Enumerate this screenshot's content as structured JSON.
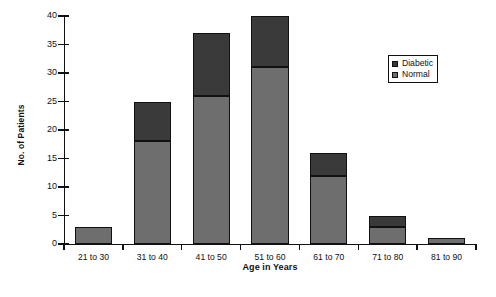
{
  "chart_data": {
    "type": "bar",
    "subtype": "stacked-bar",
    "title": "",
    "xlabel": "Age in Years",
    "ylabel": "No. of Patients",
    "categories": [
      "21 to 30",
      "31 to 40",
      "41 to 50",
      "51 to 60",
      "61 to 70",
      "71 to 80",
      "81 to 90"
    ],
    "series": [
      {
        "name": "Normal",
        "color": "#6e6e6e",
        "values": [
          3,
          18,
          26,
          31,
          12,
          3,
          1
        ]
      },
      {
        "name": "Diabetic",
        "color": "#3a3a3a",
        "values": [
          0,
          7,
          11,
          9,
          4,
          2,
          0
        ]
      }
    ],
    "totals": [
      3,
      25,
      37,
      40,
      16,
      5,
      1
    ],
    "ylim": [
      0,
      40
    ],
    "ytick_values": [
      0,
      5,
      10,
      15,
      20,
      25,
      30,
      35,
      40
    ],
    "ytick_labels": [
      "0",
      "5",
      "10",
      "15",
      "20",
      "25",
      "30",
      "35",
      "40"
    ],
    "grid": false,
    "legend_position": "upper right",
    "legend_entries": [
      "Diabetic",
      "Normal"
    ]
  }
}
